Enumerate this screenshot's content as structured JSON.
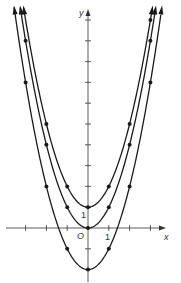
{
  "chart_data": {
    "type": "line",
    "title": "",
    "xlabel": "x",
    "ylabel": "y",
    "origin_label": "O",
    "tick_labels": {
      "x": [
        "1"
      ],
      "y": [
        "1"
      ]
    },
    "xlim": [
      -3.5,
      4
    ],
    "ylim": [
      -2.7,
      10.5
    ],
    "grid": false,
    "legend": null,
    "series": [
      {
        "name": "y = x^2 + 1",
        "x": [
          -2,
          -1,
          0,
          1,
          2,
          3
        ],
        "y": [
          5,
          2,
          1,
          2,
          5,
          10
        ]
      },
      {
        "name": "y = x^2",
        "x": [
          -3,
          -2,
          -1,
          0,
          1,
          2,
          3
        ],
        "y": [
          9,
          4,
          1,
          0,
          1,
          4,
          9
        ]
      },
      {
        "name": "y = x^2 - 2",
        "x": [
          -3,
          -2,
          -1,
          0,
          1,
          2,
          3
        ],
        "y": [
          7,
          2,
          -1,
          -2,
          -1,
          2,
          7
        ]
      }
    ]
  },
  "colors": {
    "curve": "#1a1a1a",
    "axis": "#333333"
  }
}
